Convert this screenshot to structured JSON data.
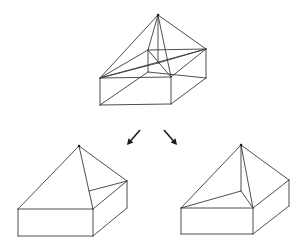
{
  "diagram": {
    "figures": [
      {
        "id": "top",
        "role": "source",
        "label": "",
        "vertices": {
          "apex": [
            158,
            15
          ],
          "lt": [
            100,
            78
          ],
          "ft": [
            171,
            77
          ],
          "rt": [
            206,
            49
          ],
          "bt": [
            148,
            50
          ],
          "lb": [
            100,
            105
          ],
          "fb": [
            171,
            104
          ],
          "rb": [
            206,
            78
          ],
          "bb": [
            148,
            72
          ],
          "c": [
            158,
            63
          ]
        },
        "edges": [
          [
            "lt",
            "ft"
          ],
          [
            "ft",
            "rt"
          ],
          [
            "rt",
            "bt"
          ],
          [
            "bt",
            "lt"
          ],
          [
            "lt",
            "lb"
          ],
          [
            "ft",
            "fb"
          ],
          [
            "rt",
            "rb"
          ],
          [
            "bt",
            "bb"
          ],
          [
            "lb",
            "fb"
          ],
          [
            "fb",
            "rb"
          ],
          [
            "lb",
            "bb"
          ],
          [
            "bb",
            "rb"
          ],
          [
            "apex",
            "lt"
          ],
          [
            "apex",
            "ft"
          ],
          [
            "apex",
            "rt"
          ],
          [
            "apex",
            "bt"
          ],
          [
            "apex",
            "c"
          ],
          [
            "lt",
            "rt"
          ],
          [
            "bt",
            "ft"
          ],
          [
            "lt",
            "c"
          ],
          [
            "c",
            "rt"
          ]
        ]
      },
      {
        "id": "left",
        "role": "result",
        "label": "",
        "vertices": {
          "apex": [
            79,
            146
          ],
          "lt": [
            18,
            209
          ],
          "ft": [
            93,
            209
          ],
          "rt": [
            127,
            181
          ],
          "lb": [
            18,
            236
          ],
          "fb": [
            93,
            236
          ],
          "rb": [
            127,
            208
          ],
          "p": [
            89,
            191
          ]
        },
        "edges": [
          [
            "apex",
            "lt"
          ],
          [
            "apex",
            "ft"
          ],
          [
            "apex",
            "rt"
          ],
          [
            "lt",
            "ft"
          ],
          [
            "ft",
            "rt"
          ],
          [
            "p",
            "rt"
          ],
          [
            "lt",
            "lb"
          ],
          [
            "ft",
            "fb"
          ],
          [
            "rt",
            "rb"
          ],
          [
            "lb",
            "fb"
          ],
          [
            "fb",
            "rb"
          ]
        ]
      },
      {
        "id": "right",
        "role": "result",
        "label": "",
        "vertices": {
          "apex": [
            241,
            145
          ],
          "lt": [
            181,
            208
          ],
          "ft": [
            253,
            208
          ],
          "rt": [
            289,
            180
          ],
          "lb": [
            181,
            234
          ],
          "fb": [
            253,
            234
          ],
          "rb": [
            289,
            206
          ],
          "p": [
            241,
            191
          ]
        },
        "edges": [
          [
            "apex",
            "lt"
          ],
          [
            "apex",
            "ft"
          ],
          [
            "apex",
            "rt"
          ],
          [
            "apex",
            "p"
          ],
          [
            "p",
            "lt"
          ],
          [
            "p",
            "ft"
          ],
          [
            "lt",
            "ft"
          ],
          [
            "ft",
            "rt"
          ],
          [
            "lt",
            "lb"
          ],
          [
            "ft",
            "fb"
          ],
          [
            "rt",
            "rb"
          ],
          [
            "lb",
            "fb"
          ],
          [
            "fb",
            "rb"
          ]
        ]
      }
    ],
    "arrows": [
      {
        "id": "arrow-left",
        "from": [
          140,
          130
        ],
        "to": [
          127,
          145
        ]
      },
      {
        "id": "arrow-right",
        "from": [
          164,
          130
        ],
        "to": [
          177,
          145
        ]
      }
    ]
  }
}
